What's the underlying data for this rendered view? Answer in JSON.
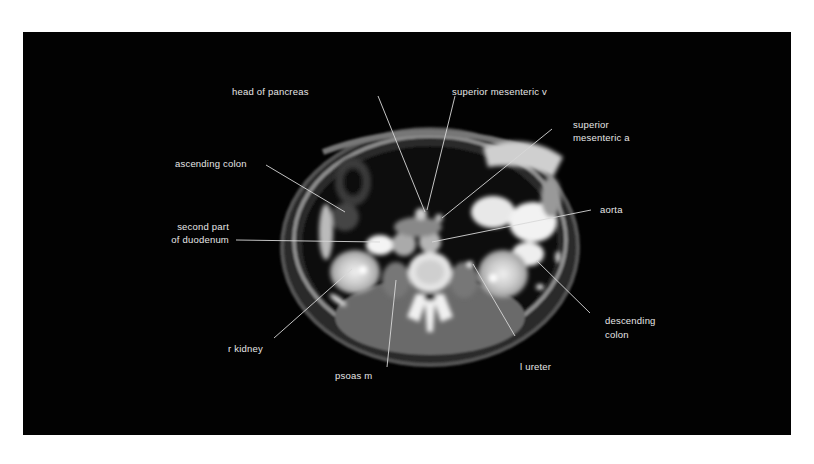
{
  "figure": {
    "background_color": "#ffffff",
    "panel_color": "#020202",
    "label_color": "#e6e6e6",
    "leader_line_color": "#d8d8d8",
    "image_type": "axial CT abdomen with contrast",
    "labels": {
      "head_of_pancreas": "head of pancreas",
      "superior_mesenteric_v": "superior mesenteric v",
      "superior_mesenteric_a_line1": "superior",
      "superior_mesenteric_a_line2": "mesenteric a",
      "ascending_colon": "ascending colon",
      "aorta": "aorta",
      "second_part_duodenum_line1": "second part",
      "second_part_duodenum_line2": "of duodenum",
      "descending_colon_line1": "descending",
      "descending_colon_line2": "colon",
      "r_kidney": "r kidney",
      "psoas_m": "psoas m",
      "l_ureter": "l ureter"
    }
  }
}
